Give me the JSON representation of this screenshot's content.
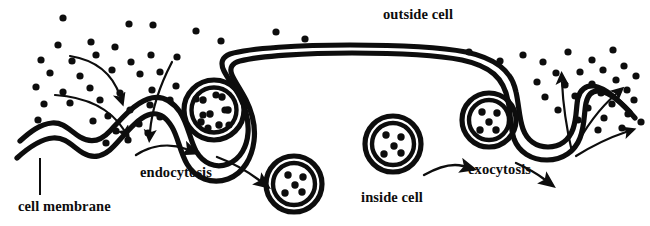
{
  "figure": {
    "ink_color": "#0d0d0d",
    "background_color": "#ffffff",
    "width": 650,
    "height": 226
  },
  "labels": {
    "outside_cell": "outside cell",
    "inside_cell": "inside cell",
    "cell_membrane": "cell membrane",
    "endocytosis": "endocytosis",
    "exocytosis": "exocytosis"
  },
  "structures": {
    "membrane_name": "cell-membrane-bilayer",
    "endocytosis_pocket_name": "endocytosis-invagination",
    "exocytosis_pocket_name": "exocytosis-invagination",
    "vesicles": [
      {
        "name": "budding-vesicle",
        "cx": 214,
        "cy": 110,
        "r": 30,
        "dots": 6
      },
      {
        "name": "free-vesicle-endocytosis",
        "cx": 294,
        "cy": 184,
        "r": 28,
        "dots": 5
      },
      {
        "name": "free-vesicle-exocytosis",
        "cx": 393,
        "cy": 144,
        "r": 28,
        "dots": 5
      },
      {
        "name": "fusing-vesicle",
        "cx": 489,
        "cy": 120,
        "r": 27,
        "dots": 5
      }
    ]
  },
  "molecules": {
    "name": "molecule-dot",
    "radius": 3.6,
    "outside_left": [
      [
        63,
        18
      ],
      [
        129,
        24
      ],
      [
        153,
        25
      ],
      [
        196,
        31
      ],
      [
        221,
        41
      ],
      [
        91,
        42
      ],
      [
        58,
        45
      ],
      [
        115,
        47
      ],
      [
        276,
        32
      ],
      [
        305,
        39
      ],
      [
        41,
        60
      ],
      [
        72,
        61
      ],
      [
        96,
        55
      ],
      [
        151,
        55
      ],
      [
        131,
        62
      ],
      [
        177,
        57
      ],
      [
        50,
        73
      ],
      [
        80,
        76
      ],
      [
        112,
        70
      ],
      [
        36,
        87
      ],
      [
        63,
        92
      ],
      [
        90,
        88
      ],
      [
        140,
        74
      ],
      [
        160,
        72
      ],
      [
        44,
        104
      ],
      [
        70,
        103
      ],
      [
        100,
        100
      ],
      [
        120,
        93
      ],
      [
        152,
        90
      ],
      [
        176,
        86
      ],
      [
        38,
        120
      ],
      [
        108,
        116
      ],
      [
        130,
        110
      ],
      [
        150,
        105
      ],
      [
        170,
        100
      ],
      [
        93,
        121
      ],
      [
        116,
        131
      ],
      [
        139,
        124
      ],
      [
        160,
        117
      ],
      [
        106,
        143
      ],
      [
        128,
        140
      ],
      [
        148,
        133
      ]
    ],
    "inside_pocket_left": [
      [
        196,
        99
      ],
      [
        216,
        95
      ],
      [
        203,
        115
      ],
      [
        225,
        110
      ],
      [
        208,
        128
      ],
      [
        229,
        125
      ]
    ],
    "outside_right": [
      [
        469,
        52
      ],
      [
        500,
        61
      ],
      [
        523,
        55
      ],
      [
        543,
        62
      ],
      [
        568,
        52
      ],
      [
        592,
        60
      ],
      [
        613,
        50
      ],
      [
        556,
        73
      ],
      [
        580,
        72
      ],
      [
        603,
        70
      ],
      [
        624,
        66
      ],
      [
        537,
        82
      ],
      [
        565,
        85
      ],
      [
        592,
        84
      ],
      [
        616,
        80
      ],
      [
        636,
        76
      ],
      [
        545,
        97
      ],
      [
        575,
        96
      ],
      [
        601,
        93
      ],
      [
        627,
        90
      ],
      [
        558,
        110
      ],
      [
        588,
        108
      ],
      [
        612,
        104
      ],
      [
        634,
        100
      ],
      [
        578,
        120
      ],
      [
        604,
        118
      ],
      [
        628,
        114
      ],
      [
        598,
        130
      ],
      [
        622,
        128
      ],
      [
        641,
        122
      ]
    ]
  },
  "arrows": {
    "converging_into_cell": {
      "name": "endocytosis-molecule-arrows",
      "count": 3,
      "direction": "inward-down"
    },
    "diverging_out_of_cell": {
      "name": "exocytosis-molecule-arrows",
      "count": 3,
      "direction": "outward-up"
    },
    "process_arrows": [
      {
        "name": "endocytosis-arrow-1"
      },
      {
        "name": "endocytosis-arrow-2"
      },
      {
        "name": "exocytosis-arrow-1"
      },
      {
        "name": "exocytosis-arrow-2"
      }
    ],
    "leader_line": {
      "name": "cell-membrane-leader-line"
    }
  }
}
